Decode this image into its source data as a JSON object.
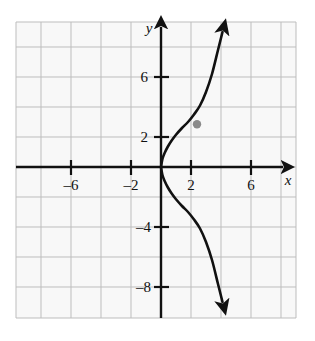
{
  "figure": {
    "kind": "coordinate-grid-graph",
    "background_color": "#ffffff",
    "plot_area_fill": "#f7f7f7",
    "grid_color": "#b9b9b9",
    "grid_minor_color": "#d8d8d8",
    "axis_color": "#111111",
    "curve_color": "#111111",
    "point_color": "#8a8a8a"
  },
  "axes": {
    "x_label": "x",
    "y_label": "y",
    "x_ticks": [
      {
        "label": "–6",
        "value": -6
      },
      {
        "label": "–2",
        "value": -2
      },
      {
        "label": "2",
        "value": 2
      },
      {
        "label": "6",
        "value": 6
      }
    ],
    "y_ticks": [
      {
        "label": "6",
        "value": 6
      },
      {
        "label": "2",
        "value": 2
      },
      {
        "label": "–4",
        "value": -4
      },
      {
        "label": "–8",
        "value": -8
      }
    ],
    "x_range": [
      -9.6,
      9.0
    ],
    "y_range": [
      -9.8,
      9.6
    ],
    "grid_spacing_units": 2,
    "grid": true
  },
  "chart_data": {
    "type": "line",
    "title": "",
    "xlabel": "x",
    "ylabel": "y",
    "xlim": [
      -9.6,
      9.0
    ],
    "ylim": [
      -9.8,
      9.6
    ],
    "grid": true,
    "legend": "none",
    "series": [
      {
        "name": "upper branch",
        "description": "Upper half of a sideways parabola opening to the right from the origin; arrowhead at the top end.",
        "arrow_end": "start-arrow-at-upper-end",
        "x": [
          0.0,
          0.1,
          0.25,
          0.45,
          0.7,
          1.0,
          1.4,
          1.8,
          2.2,
          2.6,
          3.0,
          3.4,
          3.8,
          4.1
        ],
        "y": [
          0.0,
          0.55,
          0.95,
          1.35,
          1.75,
          2.15,
          2.6,
          3.0,
          3.5,
          4.1,
          5.0,
          6.2,
          7.8,
          9.0
        ]
      },
      {
        "name": "lower branch",
        "description": "Lower half of the same sideways parabola, reflected through the x-axis; arrowhead at the bottom end.",
        "arrow_end": "arrow-at-lower-end",
        "x": [
          0.0,
          0.1,
          0.25,
          0.45,
          0.7,
          1.0,
          1.4,
          1.8,
          2.2,
          2.6,
          3.0,
          3.4,
          3.8,
          4.1
        ],
        "y": [
          0.0,
          -0.55,
          -0.95,
          -1.35,
          -1.75,
          -2.15,
          -2.6,
          -3.0,
          -3.5,
          -4.1,
          -5.0,
          -6.2,
          -7.8,
          -9.0
        ]
      }
    ],
    "points": [
      {
        "name": "marked-point",
        "x": 2.4,
        "y": 2.85,
        "label": "",
        "color": "#8a8a8a"
      }
    ]
  }
}
